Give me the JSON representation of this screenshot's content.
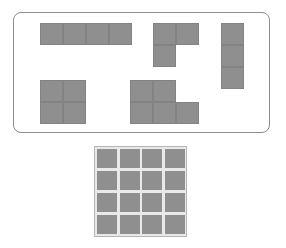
{
  "tray": {
    "label": "",
    "cell_size": [
      23,
      22
    ],
    "pieces": [
      {
        "name": "I-tetromino-horizontal",
        "origin": [
          40,
          23
        ],
        "cells": [
          [
            0,
            0
          ],
          [
            1,
            0
          ],
          [
            2,
            0
          ],
          [
            3,
            0
          ]
        ]
      },
      {
        "name": "L-tromino",
        "origin": [
          153,
          23
        ],
        "cells": [
          [
            0,
            0
          ],
          [
            1,
            0
          ],
          [
            0,
            1
          ]
        ]
      },
      {
        "name": "I-tromino-vertical",
        "origin": [
          221,
          23
        ],
        "cells": [
          [
            0,
            0
          ],
          [
            0,
            1
          ],
          [
            0,
            2
          ]
        ]
      },
      {
        "name": "O-tetromino",
        "origin": [
          40,
          80
        ],
        "cells": [
          [
            0,
            0
          ],
          [
            1,
            0
          ],
          [
            0,
            1
          ],
          [
            1,
            1
          ]
        ]
      },
      {
        "name": "P-pentomino",
        "origin": [
          130,
          80
        ],
        "cells": [
          [
            0,
            0
          ],
          [
            1,
            0
          ],
          [
            0,
            1
          ],
          [
            1,
            1
          ],
          [
            2,
            1
          ]
        ]
      }
    ]
  },
  "board": {
    "rows": 4,
    "cols": 4,
    "filled": true
  },
  "colors": {
    "piece": "#8f8f8f",
    "piece_border": "#838383",
    "tray_border": "#8c8c8c",
    "board_border": "#b5b5b5",
    "gap": "#e9e9e9"
  }
}
